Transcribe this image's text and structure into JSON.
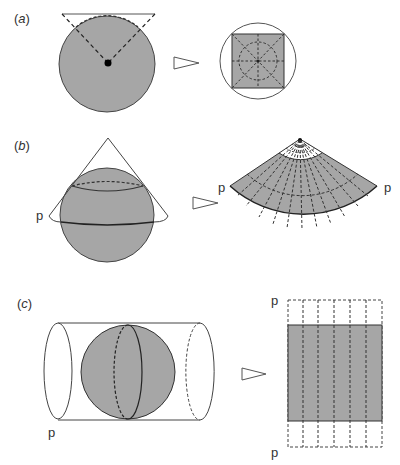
{
  "figure": {
    "panels": [
      {
        "id": "a",
        "label_open": "(",
        "label_letter": "a",
        "label_close": ")",
        "projection": "planar (azimuthal)",
        "source": "sphere with tangent plane, dashed projection lines to centre",
        "result": "circle with inscribed grey square and dashed graticule"
      },
      {
        "id": "b",
        "label_open": "(",
        "label_letter": "b",
        "label_close": ")",
        "projection": "conic",
        "source": "sphere inside cone, standard parallel",
        "result": "fan-shaped developed cone with dashed meridians and parallel",
        "point_labels": [
          "p",
          "p",
          "p"
        ]
      },
      {
        "id": "c",
        "label_open": "(",
        "label_letter": "c",
        "label_close": ")",
        "projection": "cylindrical",
        "source": "sphere inside cylinder",
        "result": "grey rectangle with dashed meridian strips",
        "point_labels": [
          "p",
          "p",
          "p"
        ]
      }
    ],
    "arrow_icon": "hollow-triangle-arrow",
    "colors": {
      "fill": "#a6a6a6",
      "stroke": "#333333",
      "background": "#ffffff"
    }
  }
}
